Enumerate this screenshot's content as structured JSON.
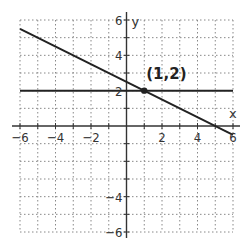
{
  "chart_data": {
    "type": "line",
    "title": "",
    "xlabel": "x",
    "ylabel": "y",
    "xlim": [
      -6,
      6
    ],
    "ylim": [
      -6,
      6
    ],
    "grid": true,
    "grid_style": "dotted",
    "x_ticks": [
      -6,
      -4,
      -2,
      2,
      4,
      6
    ],
    "y_ticks": [
      6,
      4,
      2,
      -4,
      -6
    ],
    "x_tick_labels": [
      "-6",
      "-4",
      "-2",
      "2",
      "4",
      "6"
    ],
    "y_tick_labels": [
      "6",
      "4",
      "2",
      "-4",
      "-6"
    ],
    "series": [
      {
        "name": "horizontal line y = 2",
        "x": [
          -6,
          6
        ],
        "y": [
          2,
          2
        ]
      },
      {
        "name": "sloped line y = -x/2 + 5/2",
        "x": [
          -6,
          6
        ],
        "y": [
          5.5,
          -0.5
        ]
      }
    ],
    "points": [
      {
        "x": 1,
        "y": 2,
        "label": "(1,2)"
      }
    ],
    "annotations": [
      "(1,2)"
    ],
    "colors": {
      "lines": "#222222",
      "grid": "#888888",
      "axes": "#333333"
    }
  }
}
